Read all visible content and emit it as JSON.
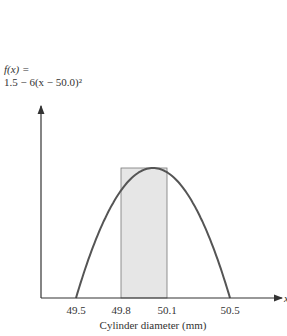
{
  "chart_data": {
    "type": "line",
    "title": "",
    "function_label_line1": "f(x) =",
    "function_label_line2": "1.5 − 6(x − 50.0)²",
    "xlabel": "Cylinder diameter (mm)",
    "x_axis_symbol": "x",
    "ylabel": "f(x)",
    "x_ticks": [
      "49.5",
      "49.8",
      "50.1",
      "50.5"
    ],
    "xlim": [
      49.5,
      50.5
    ],
    "shaded_interval": [
      49.8,
      50.1
    ],
    "series": [
      {
        "name": "f(x) = 1.5 - 6(x - 50.0)^2",
        "x": [
          49.5,
          49.6,
          49.7,
          49.8,
          49.9,
          50.0,
          50.1,
          50.2,
          50.3,
          50.4,
          50.5
        ],
        "y": [
          0.0,
          0.54,
          0.96,
          1.26,
          1.44,
          1.5,
          1.44,
          1.26,
          0.96,
          0.54,
          0.0
        ]
      }
    ],
    "grid": false,
    "colors": {
      "curve": "#555555",
      "shade": "#e6e6e6",
      "axis": "#333333"
    }
  }
}
